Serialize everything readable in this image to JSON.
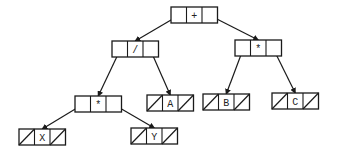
{
  "diagram": {
    "type": "expression-tree",
    "nodes": [
      {
        "id": "plus",
        "label": "+",
        "x": 171,
        "y": 7,
        "leaf": false
      },
      {
        "id": "div",
        "label": "/",
        "x": 112,
        "y": 41,
        "leaf": false
      },
      {
        "id": "mulR",
        "label": "*",
        "x": 235,
        "y": 40,
        "leaf": false
      },
      {
        "id": "mulL",
        "label": "*",
        "x": 75,
        "y": 96,
        "leaf": false
      },
      {
        "id": "A",
        "label": "A",
        "x": 147,
        "y": 95,
        "leaf": true
      },
      {
        "id": "B",
        "label": "B",
        "x": 203,
        "y": 94,
        "leaf": true
      },
      {
        "id": "C",
        "label": "C",
        "x": 272,
        "y": 93,
        "leaf": true
      },
      {
        "id": "X",
        "label": "X",
        "x": 19,
        "y": 129,
        "leaf": true
      },
      {
        "id": "Y",
        "label": "Y",
        "x": 131,
        "y": 128,
        "leaf": true
      }
    ],
    "edges": [
      {
        "from": "plus",
        "side": "left",
        "to": "div"
      },
      {
        "from": "plus",
        "side": "right",
        "to": "mulR"
      },
      {
        "from": "div",
        "side": "left",
        "to": "mulL"
      },
      {
        "from": "div",
        "side": "right",
        "to": "A"
      },
      {
        "from": "mulR",
        "side": "left",
        "to": "B"
      },
      {
        "from": "mulR",
        "side": "right",
        "to": "C"
      },
      {
        "from": "mulL",
        "side": "left",
        "to": "X"
      },
      {
        "from": "mulL",
        "side": "right",
        "to": "Y"
      }
    ],
    "cell_width": 15.5,
    "cell_height": 16,
    "stroke_color": "#1a1a1a"
  }
}
